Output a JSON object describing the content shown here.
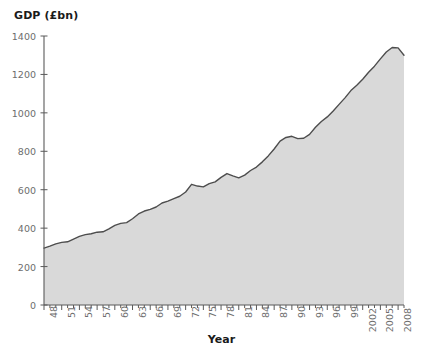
{
  "chart_data": {
    "type": "area",
    "title": "",
    "ylabel": "GDP (£bn)",
    "xlabel": "Year",
    "ylim": [
      0,
      1400
    ],
    "ytick_step": 200,
    "yticks": [
      "0",
      "200",
      "400",
      "600",
      "800",
      "1000",
      "1200",
      "1400"
    ],
    "xlim": [
      1948,
      2009
    ],
    "xtick_step": 3,
    "xticks": [
      "48",
      "51",
      "54",
      "57",
      "60",
      "63",
      "66",
      "69",
      "72",
      "75",
      "78",
      "81",
      "84",
      "87",
      "90",
      "93",
      "96",
      "99",
      "2002",
      "2005",
      "2008"
    ],
    "grid": false,
    "legend": null,
    "line_color": "#4d4d4d",
    "fill_color": "#d9d9d9",
    "axis_color": "#5a5a5a",
    "tick_label_color": "#6d6d6d",
    "background_color": "#ffffff",
    "x": [
      1948,
      1949,
      1950,
      1951,
      1952,
      1953,
      1954,
      1955,
      1956,
      1957,
      1958,
      1959,
      1960,
      1961,
      1962,
      1963,
      1964,
      1965,
      1966,
      1967,
      1968,
      1969,
      1970,
      1971,
      1972,
      1973,
      1974,
      1975,
      1976,
      1977,
      1978,
      1979,
      1980,
      1981,
      1982,
      1983,
      1984,
      1985,
      1986,
      1987,
      1988,
      1989,
      1990,
      1991,
      1992,
      1993,
      1994,
      1995,
      1996,
      1997,
      1998,
      1999,
      2000,
      2001,
      2002,
      2003,
      2004,
      2005,
      2006,
      2007,
      2008,
      2009
    ],
    "values": [
      296,
      306,
      318,
      326,
      329,
      343,
      357,
      366,
      371,
      379,
      381,
      396,
      414,
      425,
      429,
      449,
      474,
      489,
      498,
      510,
      531,
      541,
      554,
      566,
      588,
      628,
      619,
      615,
      632,
      641,
      664,
      684,
      672,
      662,
      676,
      700,
      718,
      745,
      776,
      812,
      853,
      872,
      878,
      866,
      868,
      888,
      925,
      955,
      979,
      1010,
      1044,
      1078,
      1116,
      1144,
      1175,
      1211,
      1243,
      1281,
      1317,
      1340,
      1338,
      1300
    ],
    "annotations": []
  }
}
